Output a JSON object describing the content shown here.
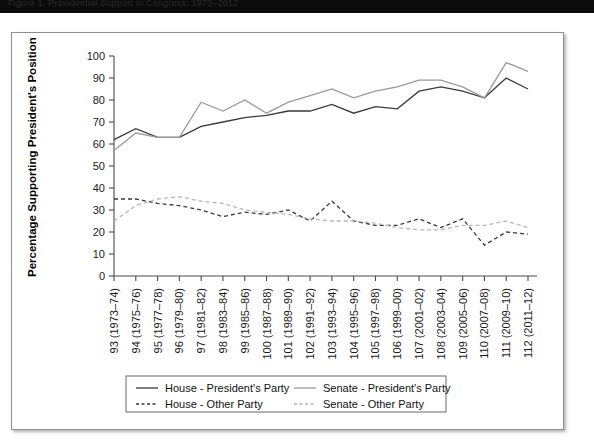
{
  "caption": {
    "text": "Figure 1.  Presidential Support in Congress, 1973–2012"
  },
  "chart_data": {
    "type": "line",
    "title": "",
    "xlabel": "",
    "ylabel": "Percentage Supporting President's Position",
    "ylim": [
      0,
      100
    ],
    "yticks": [
      0,
      10,
      20,
      30,
      40,
      50,
      60,
      70,
      80,
      90,
      100
    ],
    "grid": false,
    "legend_position": "bottom",
    "categories": [
      "93 (1973–74)",
      "94 (1975–76)",
      "95 (1977–78)",
      "96 (1979–80)",
      "97 (1981–82)",
      "98 (1983–84)",
      "99 (1985–86)",
      "100 (1987–88)",
      "101 (1989–90)",
      "102 (1991–92)",
      "103 (1993–94)",
      "104 (1995–96)",
      "105 (1997–98)",
      "106 (1999–00)",
      "107 (2001–02)",
      "108 (2003–04)",
      "109 (2005–06)",
      "110 (2007–08)",
      "111 (2009–10)",
      "112 (2011–12)"
    ],
    "series": [
      {
        "name": "House - President's Party",
        "key": "house_president",
        "color": "#3a3a3a",
        "dash": "none",
        "width": 1.3,
        "values": [
          62,
          67,
          63,
          63,
          68,
          70,
          72,
          73,
          75,
          75,
          78,
          74,
          77,
          76,
          84,
          86,
          84,
          81,
          90,
          85
        ]
      },
      {
        "name": "Senate - President's Party",
        "key": "senate_president",
        "color": "#9a9a9a",
        "dash": "none",
        "width": 1.3,
        "values": [
          57,
          65,
          63,
          63,
          79,
          75,
          80,
          74,
          79,
          82,
          85,
          81,
          84,
          86,
          89,
          89,
          86,
          81,
          97,
          93
        ]
      },
      {
        "name": "House - Other Party",
        "key": "house_other",
        "color": "#3a3a3a",
        "dash": "4,3",
        "width": 1.3,
        "values": [
          35,
          35,
          33,
          32,
          30,
          27,
          29,
          28,
          30,
          25,
          34,
          25,
          23,
          23,
          26,
          22,
          26,
          14,
          20,
          19
        ]
      },
      {
        "name": "Senate - Other Party",
        "key": "senate_other",
        "color": "#b8b8b8",
        "dash": "4,3",
        "width": 1.3,
        "values": [
          25,
          32,
          35,
          36,
          34,
          33,
          30,
          29,
          28,
          26,
          25,
          25,
          24,
          22,
          21,
          21,
          23,
          23,
          25,
          22
        ]
      }
    ]
  },
  "legend": {
    "items": [
      {
        "label": "House - President's Party",
        "style": "solid",
        "color": "#3a3a3a"
      },
      {
        "label": "Senate - President's  Party",
        "style": "solid",
        "color": "#9a9a9a"
      },
      {
        "label": "House - Other Party",
        "style": "dashed",
        "color": "#3a3a3a"
      },
      {
        "label": "Senate - Other Party",
        "style": "dashed",
        "color": "#b8b8b8"
      }
    ]
  },
  "colors": {
    "house": "#3a3a3a",
    "senate": "#9a9a9a",
    "senate_light": "#b8b8b8",
    "axis": "#4a4a4a",
    "panel_border": "#8f8f8f"
  }
}
